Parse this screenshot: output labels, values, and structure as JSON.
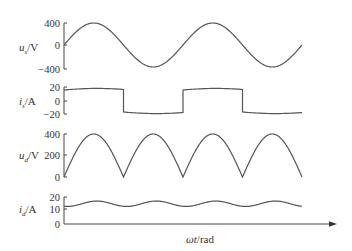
{
  "chart_data": [
    {
      "type": "line",
      "title": "",
      "ylabel": "u_s/V",
      "ylabel_main": "u",
      "ylabel_sub": "s",
      "ylabel_unit": "/V",
      "yticks": [
        "400",
        "0",
        "−400"
      ],
      "ylim": [
        -400,
        400
      ],
      "description": "Supply voltage: sinusoid, amplitude ~400 V, 2 cycles",
      "amplitude": 400,
      "cycles": 2
    },
    {
      "type": "line",
      "ylabel": "i_s/A",
      "ylabel_main": "i",
      "ylabel_sub": "s",
      "ylabel_unit": "/A",
      "yticks": [
        "20",
        "0",
        "−20"
      ],
      "ylim": [
        -20,
        20
      ],
      "description": "Supply current: quasi-square wave ~±17 A in phase with u_s",
      "amplitude": 17
    },
    {
      "type": "line",
      "ylabel": "u_d/V",
      "ylabel_main": "u",
      "ylabel_sub": "d",
      "ylabel_unit": "/V",
      "yticks": [
        "400",
        "200",
        "0"
      ],
      "ylim": [
        0,
        400
      ],
      "description": "Rectified DC voltage: |sin|, peak ~400 V, 4 half-cycles",
      "amplitude": 400
    },
    {
      "type": "line",
      "ylabel": "i_d/A",
      "ylabel_main": "i",
      "ylabel_sub": "d",
      "ylabel_unit": "/A",
      "yticks": [
        "20",
        "10",
        "0"
      ],
      "ylim": [
        0,
        20
      ],
      "description": "DC current: ~15 A with ripple between ~13 A and ~17 A",
      "mean": 15,
      "ripple": 2
    }
  ],
  "xaxis": {
    "label_main": "ωt",
    "label_unit": "/rad"
  }
}
